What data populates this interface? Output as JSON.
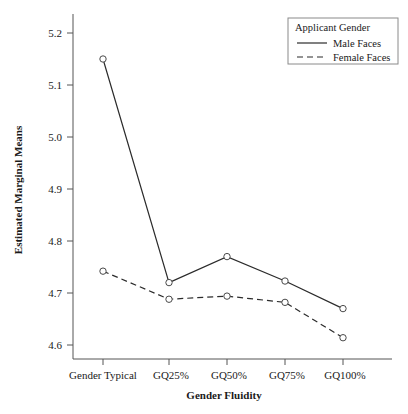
{
  "chart_data": {
    "type": "line",
    "title": "",
    "xlabel": "Gender Fluidity",
    "ylabel": "Estimated Marginal Means",
    "categories": [
      "Gender Typical",
      "GQ25%",
      "GQ50%",
      "GQ75%",
      "GQ100%"
    ],
    "series": [
      {
        "name": "Male Faces",
        "style": "solid",
        "values": [
          5.15,
          4.72,
          4.77,
          4.723,
          4.67
        ]
      },
      {
        "name": "Female Faces",
        "style": "dashed",
        "values": [
          4.742,
          4.688,
          4.694,
          4.682,
          4.614
        ]
      }
    ],
    "ylim": [
      4.555,
      5.235
    ],
    "yticks": [
      "5.2",
      "5.1",
      "5.0",
      "4.9",
      "4.8",
      "4.7",
      "4.6"
    ],
    "ytick_values": [
      5.2,
      5.1,
      5.0,
      4.9,
      4.8,
      4.7,
      4.6
    ],
    "grid": false,
    "legend": {
      "title": "Applicant Gender",
      "position": "top-right",
      "entries": [
        {
          "label": "Male Faces",
          "style": "solid"
        },
        {
          "label": "Female Faces",
          "style": "dashed"
        }
      ]
    },
    "marker": "open-circle",
    "line_color": "#2b2b2b",
    "background": "#ffffff"
  }
}
